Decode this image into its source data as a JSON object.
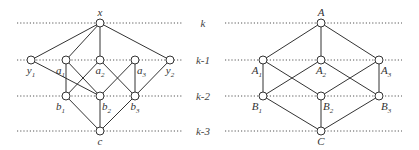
{
  "colors": {
    "stroke": "#333333",
    "level_line": "#555555",
    "node_fill": "#ffffff",
    "background": "#ffffff"
  },
  "levels": [
    {
      "label": "k",
      "y": 23
    },
    {
      "label": "k-1",
      "y": 60
    },
    {
      "label": "k-2",
      "y": 96
    },
    {
      "label": "k-3",
      "y": 131
    }
  ],
  "left_diagram": {
    "line_x": [
      17,
      182
    ],
    "nodes": [
      {
        "id": "x",
        "base": "x",
        "sub": "",
        "x": 100,
        "y": 23,
        "label_pos": "above"
      },
      {
        "id": "y1",
        "base": "y",
        "sub": "1",
        "x": 31,
        "y": 60,
        "label_pos": "below"
      },
      {
        "id": "a1",
        "base": "a",
        "sub": "1",
        "x": 66,
        "y": 60,
        "label_pos": "below-left"
      },
      {
        "id": "a2",
        "base": "a",
        "sub": "2",
        "x": 100,
        "y": 60,
        "label_pos": "below"
      },
      {
        "id": "a3",
        "base": "a",
        "sub": "3",
        "x": 135,
        "y": 60,
        "label_pos": "below-right"
      },
      {
        "id": "y2",
        "base": "y",
        "sub": "2",
        "x": 170,
        "y": 60,
        "label_pos": "below"
      },
      {
        "id": "b1",
        "base": "b",
        "sub": "1",
        "x": 66,
        "y": 96,
        "label_pos": "below-left"
      },
      {
        "id": "b2",
        "base": "b",
        "sub": "2",
        "x": 100,
        "y": 96,
        "label_pos": "below-right"
      },
      {
        "id": "b3",
        "base": "b",
        "sub": "3",
        "x": 135,
        "y": 96,
        "label_pos": "below"
      },
      {
        "id": "c",
        "base": "c",
        "sub": "",
        "x": 100,
        "y": 131,
        "label_pos": "below"
      }
    ],
    "edges": [
      [
        "x",
        "y1"
      ],
      [
        "x",
        "a1"
      ],
      [
        "x",
        "a2"
      ],
      [
        "x",
        "y2"
      ],
      [
        "y1",
        "b2"
      ],
      [
        "a1",
        "b1"
      ],
      [
        "a1",
        "b2"
      ],
      [
        "a2",
        "b1"
      ],
      [
        "a2",
        "b3"
      ],
      [
        "a3",
        "b2"
      ],
      [
        "a3",
        "b3"
      ],
      [
        "y2",
        "b3"
      ],
      [
        "b1",
        "c"
      ],
      [
        "b2",
        "c"
      ],
      [
        "b3",
        "c"
      ]
    ]
  },
  "right_diagram": {
    "line_x": [
      225,
      402
    ],
    "nodes": [
      {
        "id": "A",
        "base": "A",
        "sub": "",
        "x": 321,
        "y": 23,
        "label_pos": "above"
      },
      {
        "id": "A1",
        "base": "A",
        "sub": "1",
        "x": 263,
        "y": 60,
        "label_pos": "below-left"
      },
      {
        "id": "A2",
        "base": "A",
        "sub": "2",
        "x": 321,
        "y": 60,
        "label_pos": "below"
      },
      {
        "id": "A3",
        "base": "A",
        "sub": "3",
        "x": 379,
        "y": 60,
        "label_pos": "below-right"
      },
      {
        "id": "B1",
        "base": "B",
        "sub": "1",
        "x": 263,
        "y": 96,
        "label_pos": "below-left"
      },
      {
        "id": "B2",
        "base": "B",
        "sub": "2",
        "x": 321,
        "y": 96,
        "label_pos": "below-right"
      },
      {
        "id": "B3",
        "base": "B",
        "sub": "3",
        "x": 379,
        "y": 96,
        "label_pos": "below-right"
      },
      {
        "id": "C",
        "base": "C",
        "sub": "",
        "x": 321,
        "y": 131,
        "label_pos": "below"
      }
    ],
    "edges": [
      [
        "A",
        "A1"
      ],
      [
        "A",
        "A2"
      ],
      [
        "A",
        "A3"
      ],
      [
        "A1",
        "B1"
      ],
      [
        "A1",
        "B2"
      ],
      [
        "A2",
        "B1"
      ],
      [
        "A2",
        "B3"
      ],
      [
        "A3",
        "B2"
      ],
      [
        "A3",
        "B3"
      ],
      [
        "B1",
        "C"
      ],
      [
        "B2",
        "C"
      ],
      [
        "B3",
        "C"
      ]
    ]
  },
  "level_label_x": 203
}
